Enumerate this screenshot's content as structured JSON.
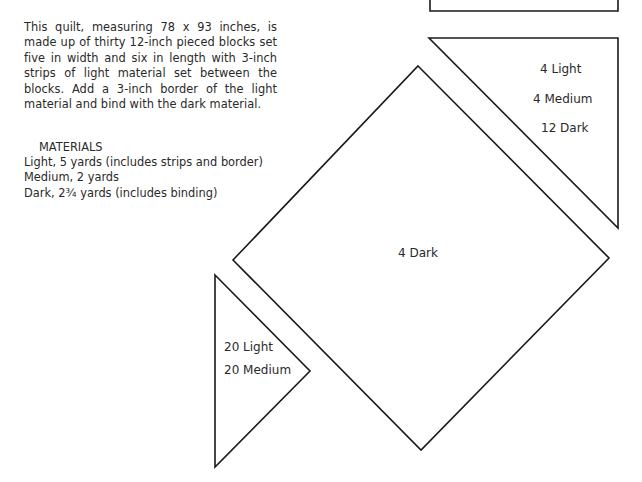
{
  "intro": {
    "text": "This quilt, measuring 78 x 93 inches, is made up of thirty 12-inch pieced blocks set five in width and six in length with 3-inch strips of light material set between the blocks. Add a 3-inch border of the light material and bind with the dark material."
  },
  "materials": {
    "heading": "MATERIALS",
    "items": [
      "Light, 5 yards (includes strips and border)",
      "Medium, 2 yards",
      "Dark, 2¾ yards (includes binding)"
    ]
  },
  "pattern_pieces": {
    "large_triangle": {
      "labels": [
        "4 Light",
        "4 Medium",
        "12 Dark"
      ]
    },
    "square": {
      "labels": [
        "4 Dark"
      ]
    },
    "small_triangle": {
      "labels": [
        "20 Light",
        "20 Medium"
      ]
    }
  },
  "colors": {
    "stroke": "#1a1a1a",
    "text": "#2a2a2a",
    "background": "#ffffff"
  }
}
